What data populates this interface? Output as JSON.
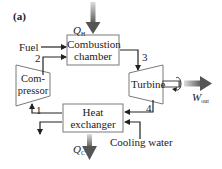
{
  "figure": {
    "panel_label": "(a)",
    "components": {
      "combustion_chamber": {
        "line1": "Combustion",
        "line2": "chamber"
      },
      "compressor": {
        "line1": "Com-",
        "line2": "pressor"
      },
      "turbine": {
        "label": "Turbine"
      },
      "heat_exchanger": {
        "line1": "Heat",
        "line2": "exchanger"
      }
    },
    "flows": {
      "fuel": "Fuel",
      "cooling_water": "Cooling water",
      "q_in": {
        "symbol": "Q",
        "subscript": "H"
      },
      "q_out": {
        "symbol": "Q",
        "subscript": "C"
      },
      "w_out": {
        "symbol": "W",
        "subscript": "out"
      }
    },
    "state_points": [
      "1",
      "2",
      "3",
      "4"
    ],
    "colors": {
      "line": "#222222",
      "box_border": "#7a7a7a",
      "arrow_dark": "#555555",
      "arrow_light": "#dddddd"
    }
  }
}
